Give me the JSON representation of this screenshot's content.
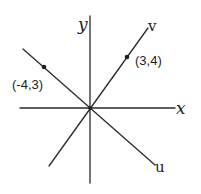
{
  "diagram": {
    "axes": {
      "x_label": "x",
      "y_label": "y"
    },
    "lines": {
      "v_label": "v",
      "u_label": "u"
    },
    "points": [
      {
        "label": "(3,4)"
      },
      {
        "label": "(-4,3)"
      }
    ],
    "stroke_color": "#2a2a2a"
  }
}
